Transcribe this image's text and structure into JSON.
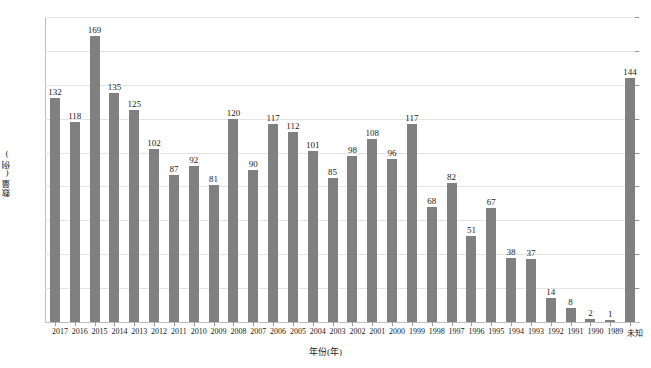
{
  "chart_data": {
    "type": "bar",
    "title": "",
    "xlabel": "年份(年)",
    "ylabel": "数量(例)",
    "ylim": [
      0,
      180
    ],
    "ytick_step": 20,
    "yticks": [
      0,
      20,
      40,
      60,
      80,
      100,
      120,
      140,
      160,
      180
    ],
    "grid": true,
    "legend": "none",
    "bar_color": "#808080",
    "gridline_color": "#e3e3e3",
    "axis_color": "#bdbdbd",
    "text_color": "#1a1a1a",
    "background": "#ffffff",
    "show_value_labels": true,
    "categories": [
      "2017",
      "2016",
      "2015",
      "2014",
      "2013",
      "2012",
      "2011",
      "2010",
      "2009",
      "2008",
      "2007",
      "2006",
      "2005",
      "2004",
      "2003",
      "2002",
      "2001",
      "2000",
      "1999",
      "1998",
      "1997",
      "1996",
      "1995",
      "1994",
      "1993",
      "1992",
      "1991",
      "1990",
      "1989",
      "未知"
    ],
    "values": [
      132,
      118,
      169,
      135,
      125,
      102,
      87,
      92,
      81,
      120,
      90,
      117,
      112,
      101,
      85,
      98,
      108,
      96,
      117,
      68,
      82,
      51,
      67,
      38,
      37,
      14,
      8,
      2,
      1,
      144
    ]
  }
}
